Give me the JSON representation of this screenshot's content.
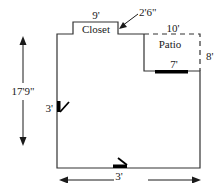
{
  "diagram": {
    "type": "floor-plan",
    "labels": {
      "closet": "Closet",
      "patio": "Patio",
      "closet_width": "9'",
      "closet_depth": "2'6\"",
      "patio_width": "10'",
      "patio_depth": "8'",
      "patio_door_width": "7'",
      "side_door_width": "3'",
      "bottom_door_width": "3'",
      "overall_height": "17'9\"",
      "overall_width": "24'8\""
    },
    "colors": {
      "wall": "#333333",
      "door": "#000000",
      "text": "#1a1a1a",
      "background": "#ffffff"
    }
  }
}
